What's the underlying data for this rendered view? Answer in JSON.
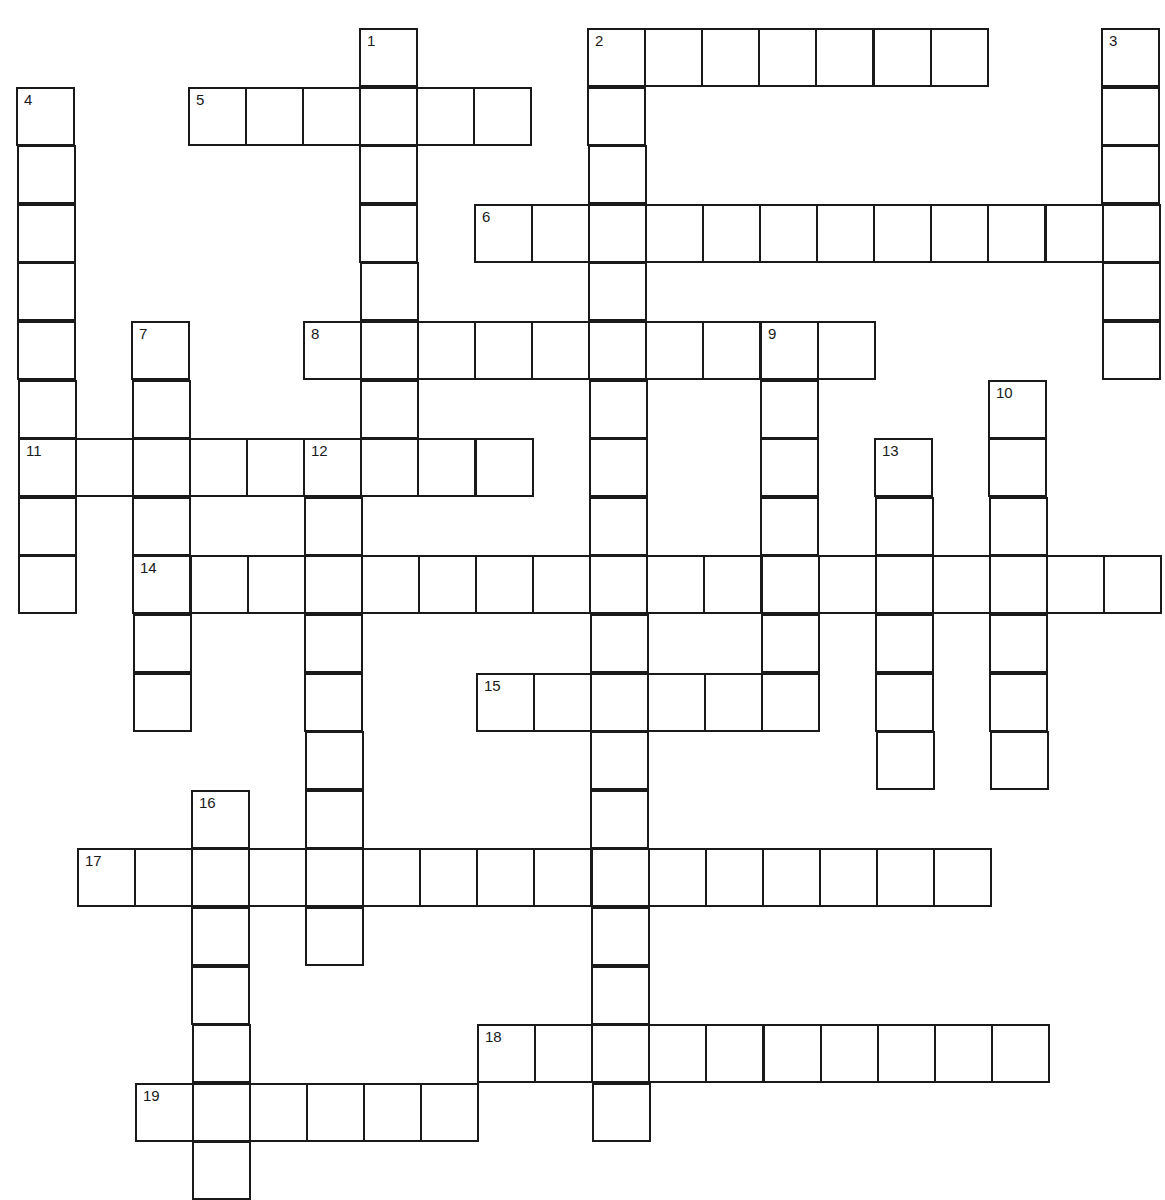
{
  "puzzle": {
    "title_fragment": "",
    "cell_size": 59,
    "origin_x": 16,
    "origin_y": 28,
    "col_step": 57.1,
    "row_step": 58.6,
    "skew_per_row": 0.25,
    "border_color": "#1a1a1a",
    "background": "#ffffff"
  },
  "words": [
    {
      "number": "1",
      "direction": "down",
      "row": 0,
      "col": 6,
      "length": 8
    },
    {
      "number": "2",
      "direction": "across",
      "row": 0,
      "col": 10,
      "length": 7
    },
    {
      "number": "2",
      "direction": "down",
      "row": 0,
      "col": 10,
      "length": 19
    },
    {
      "number": "3",
      "direction": "down",
      "row": 0,
      "col": 19,
      "length": 6
    },
    {
      "number": "4",
      "direction": "down",
      "row": 1,
      "col": 0,
      "length": 9
    },
    {
      "number": "5",
      "direction": "across",
      "row": 1,
      "col": 3,
      "length": 6
    },
    {
      "number": "6",
      "direction": "across",
      "row": 3,
      "col": 8,
      "length": 12
    },
    {
      "number": "7",
      "direction": "down",
      "row": 5,
      "col": 2,
      "length": 7
    },
    {
      "number": "8",
      "direction": "across",
      "row": 5,
      "col": 5,
      "length": 10
    },
    {
      "number": "9",
      "direction": "down",
      "row": 5,
      "col": 13,
      "length": 7
    },
    {
      "number": "10",
      "direction": "down",
      "row": 6,
      "col": 17,
      "length": 7
    },
    {
      "number": "11",
      "direction": "across",
      "row": 7,
      "col": 0,
      "length": 9
    },
    {
      "number": "12",
      "direction": "down",
      "row": 7,
      "col": 5,
      "length": 9
    },
    {
      "number": "13",
      "direction": "down",
      "row": 7,
      "col": 15,
      "length": 6
    },
    {
      "number": "14",
      "direction": "across",
      "row": 9,
      "col": 2,
      "length": 18
    },
    {
      "number": "15",
      "direction": "across",
      "row": 11,
      "col": 8,
      "length": 6
    },
    {
      "number": "16",
      "direction": "down",
      "row": 13,
      "col": 3,
      "length": 7
    },
    {
      "number": "17",
      "direction": "across",
      "row": 14,
      "col": 1,
      "length": 16
    },
    {
      "number": "18",
      "direction": "across",
      "row": 17,
      "col": 8,
      "length": 10
    },
    {
      "number": "19",
      "direction": "across",
      "row": 18,
      "col": 2,
      "length": 6
    }
  ]
}
